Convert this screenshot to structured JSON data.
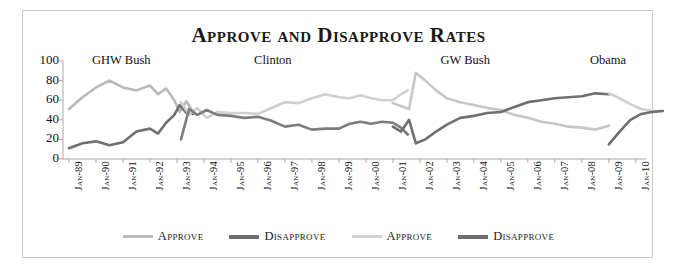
{
  "chart_data": {
    "type": "line",
    "title": "Approve and Disapprove Rates",
    "xlabel": "",
    "ylabel": "",
    "ylim": [
      0,
      100
    ],
    "yticks": [
      0,
      20,
      40,
      60,
      80,
      100
    ],
    "grid": false,
    "legend_position": "bottom",
    "x": [
      "Jan-89",
      "Jan-90",
      "Jan-91",
      "Jan-92",
      "Jan-93",
      "Jan-94",
      "Jan-95",
      "Jan-96",
      "Jan-97",
      "Jan-98",
      "Jan-99",
      "Jan-00",
      "Jan-01",
      "Jan-02",
      "Jan-03",
      "Jan-04",
      "Jan-05",
      "Jan-06",
      "Jan-07",
      "Jan-08",
      "Jan-09",
      "Jan-10"
    ],
    "annotations": [
      {
        "label": "GHW Bush",
        "x_fraction": 0.1
      },
      {
        "label": "Clinton",
        "x_fraction": 0.36
      },
      {
        "label": "GW Bush",
        "x_fraction": 0.69
      },
      {
        "label": "Obama",
        "x_fraction": 0.935
      }
    ],
    "series": [
      {
        "name": "Approve",
        "group": "republican-presidents",
        "color": "#b9b9b9",
        "width": 2.6,
        "points": [
          {
            "t": 0.0,
            "v": 51
          },
          {
            "t": 0.5,
            "v": 63
          },
          {
            "t": 1.0,
            "v": 73
          },
          {
            "t": 1.5,
            "v": 80
          },
          {
            "t": 2.0,
            "v": 73
          },
          {
            "t": 2.5,
            "v": 70
          },
          {
            "t": 3.0,
            "v": 75
          },
          {
            "t": 3.3,
            "v": 66
          },
          {
            "t": 3.6,
            "v": 72
          },
          {
            "t": 3.9,
            "v": 60
          },
          {
            "t": 4.1,
            "v": 48
          },
          {
            "t": 4.35,
            "v": 59
          },
          {
            "t": 4.6,
            "v": 48
          }
        ]
      },
      {
        "name": "Disapprove",
        "group": "republican-presidents",
        "color": "#6f6f6f",
        "width": 2.6,
        "points": [
          {
            "t": 0.0,
            "v": 11
          },
          {
            "t": 0.5,
            "v": 16
          },
          {
            "t": 1.0,
            "v": 18
          },
          {
            "t": 1.5,
            "v": 14
          },
          {
            "t": 2.0,
            "v": 17
          },
          {
            "t": 2.5,
            "v": 28
          },
          {
            "t": 3.0,
            "v": 31
          },
          {
            "t": 3.3,
            "v": 26
          },
          {
            "t": 3.6,
            "v": 37
          },
          {
            "t": 3.9,
            "v": 45
          },
          {
            "t": 4.1,
            "v": 55
          },
          {
            "t": 4.35,
            "v": 47
          },
          {
            "t": 4.6,
            "v": 46
          }
        ]
      },
      {
        "name": "Approve",
        "group": "democrat-presidents",
        "color": "#cfcfcf",
        "width": 2.6,
        "points": [
          {
            "t": 4.15,
            "v": 58
          },
          {
            "t": 4.45,
            "v": 45
          },
          {
            "t": 4.75,
            "v": 52
          },
          {
            "t": 5.1,
            "v": 42
          },
          {
            "t": 5.5,
            "v": 48
          },
          {
            "t": 6.0,
            "v": 47
          },
          {
            "t": 6.5,
            "v": 47
          },
          {
            "t": 7.0,
            "v": 46
          },
          {
            "t": 7.5,
            "v": 52
          },
          {
            "t": 8.0,
            "v": 58
          },
          {
            "t": 8.5,
            "v": 57
          },
          {
            "t": 9.0,
            "v": 62
          },
          {
            "t": 9.5,
            "v": 66
          },
          {
            "t": 10.0,
            "v": 63
          },
          {
            "t": 10.4,
            "v": 62
          },
          {
            "t": 10.8,
            "v": 65
          },
          {
            "t": 11.2,
            "v": 62
          },
          {
            "t": 11.6,
            "v": 60
          },
          {
            "t": 12.0,
            "v": 60
          },
          {
            "t": 12.3,
            "v": 66
          },
          {
            "t": 12.55,
            "v": 70
          }
        ]
      },
      {
        "name": "Disapprove",
        "group": "democrat-presidents",
        "color": "#7c7c7c",
        "width": 2.6,
        "points": [
          {
            "t": 4.15,
            "v": 20
          },
          {
            "t": 4.45,
            "v": 51
          },
          {
            "t": 4.75,
            "v": 45
          },
          {
            "t": 5.1,
            "v": 50
          },
          {
            "t": 5.5,
            "v": 45
          },
          {
            "t": 6.0,
            "v": 44
          },
          {
            "t": 6.5,
            "v": 42
          },
          {
            "t": 7.0,
            "v": 43
          },
          {
            "t": 7.5,
            "v": 39
          },
          {
            "t": 8.0,
            "v": 33
          },
          {
            "t": 8.5,
            "v": 35
          },
          {
            "t": 9.0,
            "v": 30
          },
          {
            "t": 9.5,
            "v": 31
          },
          {
            "t": 10.0,
            "v": 31
          },
          {
            "t": 10.4,
            "v": 36
          },
          {
            "t": 10.8,
            "v": 38
          },
          {
            "t": 11.2,
            "v": 36
          },
          {
            "t": 11.6,
            "v": 38
          },
          {
            "t": 12.0,
            "v": 37
          },
          {
            "t": 12.3,
            "v": 32
          },
          {
            "t": 12.55,
            "v": 25
          }
        ]
      },
      {
        "name": "Approve",
        "group": "gw-bush",
        "color": "#c6c6c6",
        "width": 2.6,
        "points": [
          {
            "t": 12.0,
            "v": 57
          },
          {
            "t": 12.3,
            "v": 54
          },
          {
            "t": 12.6,
            "v": 51
          },
          {
            "t": 12.85,
            "v": 88
          },
          {
            "t": 13.2,
            "v": 80
          },
          {
            "t": 13.6,
            "v": 70
          },
          {
            "t": 14.0,
            "v": 62
          },
          {
            "t": 14.5,
            "v": 58
          },
          {
            "t": 15.0,
            "v": 55
          },
          {
            "t": 15.5,
            "v": 52
          },
          {
            "t": 16.0,
            "v": 50
          },
          {
            "t": 16.5,
            "v": 45
          },
          {
            "t": 17.0,
            "v": 42
          },
          {
            "t": 17.5,
            "v": 38
          },
          {
            "t": 18.0,
            "v": 36
          },
          {
            "t": 18.5,
            "v": 33
          },
          {
            "t": 19.0,
            "v": 32
          },
          {
            "t": 19.5,
            "v": 30
          },
          {
            "t": 20.0,
            "v": 34
          }
        ]
      },
      {
        "name": "Disapprove",
        "group": "gw-bush",
        "color": "#6f6f6f",
        "width": 2.6,
        "points": [
          {
            "t": 12.0,
            "v": 33
          },
          {
            "t": 12.3,
            "v": 28
          },
          {
            "t": 12.6,
            "v": 40
          },
          {
            "t": 12.85,
            "v": 16
          },
          {
            "t": 13.2,
            "v": 20
          },
          {
            "t": 13.6,
            "v": 28
          },
          {
            "t": 14.0,
            "v": 35
          },
          {
            "t": 14.5,
            "v": 42
          },
          {
            "t": 15.0,
            "v": 44
          },
          {
            "t": 15.5,
            "v": 47
          },
          {
            "t": 16.0,
            "v": 48
          },
          {
            "t": 16.5,
            "v": 53
          },
          {
            "t": 17.0,
            "v": 58
          },
          {
            "t": 17.5,
            "v": 60
          },
          {
            "t": 18.0,
            "v": 62
          },
          {
            "t": 18.5,
            "v": 63
          },
          {
            "t": 19.0,
            "v": 64
          },
          {
            "t": 19.5,
            "v": 67
          },
          {
            "t": 20.0,
            "v": 66
          }
        ]
      },
      {
        "name": "Approve",
        "group": "obama",
        "color": "#cfcfcf",
        "width": 2.6,
        "points": [
          {
            "t": 20.0,
            "v": 67
          },
          {
            "t": 20.4,
            "v": 62
          },
          {
            "t": 20.8,
            "v": 56
          },
          {
            "t": 21.2,
            "v": 51
          },
          {
            "t": 21.6,
            "v": 49
          },
          {
            "t": 22.0,
            "v": 49
          }
        ]
      },
      {
        "name": "Disapprove",
        "group": "obama",
        "color": "#6f6f6f",
        "width": 2.6,
        "points": [
          {
            "t": 20.0,
            "v": 15
          },
          {
            "t": 20.4,
            "v": 28
          },
          {
            "t": 20.8,
            "v": 40
          },
          {
            "t": 21.2,
            "v": 46
          },
          {
            "t": 21.6,
            "v": 48
          },
          {
            "t": 22.0,
            "v": 49
          }
        ]
      }
    ],
    "legend": [
      {
        "label": "Approve",
        "color": "#bcbcbc",
        "width": 3
      },
      {
        "label": "Disapprove",
        "color": "#6f6f6f",
        "width": 4
      },
      {
        "label": "Approve",
        "color": "#d2d2d2",
        "width": 3
      },
      {
        "label": "Disapprove",
        "color": "#6f6f6f",
        "width": 4
      }
    ]
  }
}
